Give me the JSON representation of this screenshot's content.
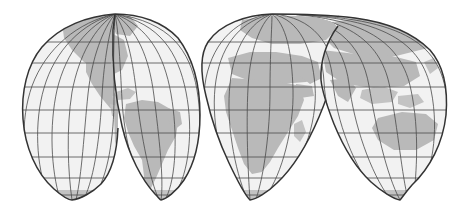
{
  "figure": {
    "kind": "interrupted-world-map",
    "projection_name": "Goode homolosine (interrupted)",
    "width": 466,
    "height": 218,
    "background_color": "#ffffff",
    "ocean_color": "#f2f2f2",
    "land_color": "#b9b9b9",
    "graticule_color": "#4a4a4a",
    "outline_color": "#333333",
    "title": "",
    "caption": "",
    "labels_visible": false
  },
  "graticule": {
    "parallel_interval_degrees": 15,
    "meridian_interval_degrees": 15,
    "equator_y": 110,
    "parallels": [
      {
        "label": "60N",
        "y": 42
      },
      {
        "label": "45N",
        "y": 63
      },
      {
        "label": "30N",
        "y": 87
      },
      {
        "label": "15N",
        "y": 98
      },
      {
        "label": "0",
        "y": 110
      },
      {
        "label": "15S",
        "y": 133
      },
      {
        "label": "30S",
        "y": 145
      },
      {
        "label": "45S",
        "y": 157
      },
      {
        "label": "60S",
        "y": 178
      },
      {
        "label": "75S",
        "y": 195
      }
    ]
  },
  "lobes": [
    {
      "name": "north-america-lobe",
      "content": "North America",
      "apex_x": 115,
      "apex_y": 14,
      "left_x": 22,
      "right_x": 118,
      "bottom_x": 72,
      "bottom_y": 200
    },
    {
      "name": "south-america-lobe",
      "content": "South America",
      "apex_x": 115,
      "apex_y": 14,
      "left_x": 113,
      "right_x": 200,
      "bottom_x": 161,
      "bottom_y": 200
    },
    {
      "name": "africa-europe-lobe",
      "content": "Europe and Africa",
      "apex_x": 272,
      "apex_y": 14,
      "left_x": 205,
      "right_x": 340,
      "bottom_x": 250,
      "bottom_y": 200
    },
    {
      "name": "asia-australia-lobe",
      "content": "Asia and Australia",
      "apex_x": 272,
      "apex_y": 14,
      "left_x": 320,
      "right_x": 448,
      "bottom_x": 400,
      "bottom_y": 200
    }
  ],
  "landmasses": [
    {
      "name": "north-america",
      "lobe": "north-america-lobe"
    },
    {
      "name": "greenland",
      "lobe": "north-america-lobe"
    },
    {
      "name": "central-america",
      "lobe": "north-america-lobe"
    },
    {
      "name": "caribbean",
      "lobe": "north-america-lobe"
    },
    {
      "name": "south-america",
      "lobe": "south-america-lobe"
    },
    {
      "name": "europe",
      "lobe": "africa-europe-lobe"
    },
    {
      "name": "africa",
      "lobe": "africa-europe-lobe"
    },
    {
      "name": "madagascar",
      "lobe": "africa-europe-lobe"
    },
    {
      "name": "arabia",
      "lobe": "africa-europe-lobe"
    },
    {
      "name": "asia",
      "lobe": "asia-australia-lobe"
    },
    {
      "name": "india",
      "lobe": "asia-australia-lobe"
    },
    {
      "name": "southeast-asia-islands",
      "lobe": "asia-australia-lobe"
    },
    {
      "name": "australia",
      "lobe": "asia-australia-lobe"
    },
    {
      "name": "new-zealand",
      "lobe": "asia-australia-lobe"
    },
    {
      "name": "japan",
      "lobe": "asia-australia-lobe"
    },
    {
      "name": "antarctica-fringe",
      "lobe": "all"
    }
  ]
}
